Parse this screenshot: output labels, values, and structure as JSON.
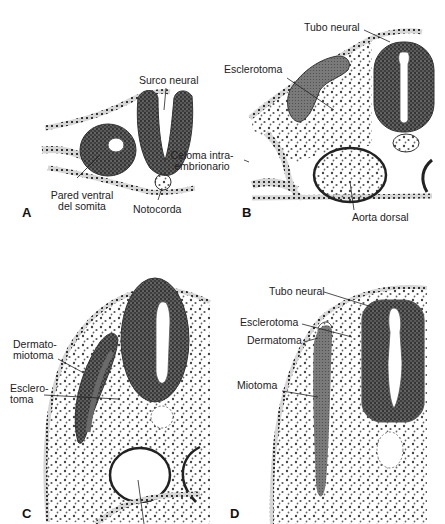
{
  "figure": {
    "panels": [
      {
        "letter": "A",
        "labels": {
          "surco_neural": "Surco neural",
          "pared_ventral_1": "Pared ventral",
          "pared_ventral_2": "del somita",
          "notocorda": "Notocorda"
        }
      },
      {
        "letter": "B",
        "labels": {
          "tubo_neural": "Tubo neural",
          "esclerotoma": "Esclerotoma",
          "celoma_1": "Celoma intra-",
          "celoma_2": "embrionario",
          "aorta_dorsal": "Aorta dorsal"
        }
      },
      {
        "letter": "C",
        "labels": {
          "dermatomiotoma_1": "Dermato-",
          "dermatomiotoma_2": "miotoma",
          "esclerotoma_1": "Esclero-",
          "esclerotoma_2": "toma"
        }
      },
      {
        "letter": "D",
        "labels": {
          "tubo_neural": "Tubo neural",
          "esclerotoma": "Esclerotoma",
          "dermatoma": "Dermatoma",
          "miotoma": "Miotoma"
        }
      }
    ],
    "colors": {
      "ink": "#1a1a1a",
      "tissue_dark": "#3a3a3a",
      "tissue_mid": "#6e6e6e",
      "tissue_light": "#bdbdbd",
      "background": "#ffffff"
    }
  }
}
